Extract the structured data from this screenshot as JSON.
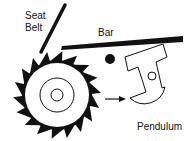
{
  "diagram": {
    "labels": {
      "seat_belt_line1": "Seat",
      "seat_belt_line2": "Belt",
      "bar": "Bar",
      "pendulum": "Pendulum"
    },
    "components": [
      "seat-belt",
      "bar",
      "ratchet-wheel",
      "pivot",
      "pendulum",
      "arrow"
    ],
    "colors": {
      "ink": "#111111",
      "background": "#ffffff"
    }
  }
}
